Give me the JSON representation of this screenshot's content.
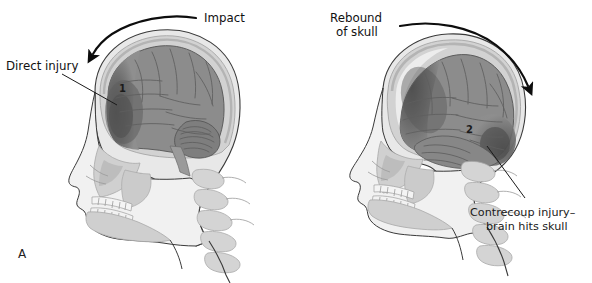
{
  "figure": {
    "panel_letter": "A",
    "background_color": "#ffffff",
    "caption_subject": "coup-contrecoup brain injury"
  },
  "labels": {
    "impact": "Impact",
    "direct_injury": "Direct injury",
    "rebound_of_skull_line1": "Rebound",
    "rebound_of_skull_line2": "of skull",
    "contrecoup_line1": "Contrecoup injury–",
    "contrecoup_line2": "brain hits skull"
  },
  "markers": {
    "coup_number": "1",
    "contrecoup_number": "2"
  },
  "panels": [
    {
      "id": "left-head",
      "name": "impact-phase-head",
      "description": "Sagittal view of head at moment of impact with direct injury at frontal lobe",
      "marker": "1"
    },
    {
      "id": "right-head",
      "name": "rebound-phase-head",
      "description": "Sagittal view of head during rebound with contrecoup injury at occipital region",
      "marker": "2"
    }
  ],
  "colors": {
    "brain_fill": "#8c8c8c",
    "brain_contusion": "#5a5a5a",
    "cerebellum": "#7e7e7e",
    "skull_bone": "#c9c9c9",
    "scalp": "#e3e3e3",
    "soft_tissue": "#d7d7d7",
    "outline": "#3a3a3a",
    "arrow": "#0d0d0d",
    "text": "#1a1a1a",
    "teeth": "#f2f2f2"
  }
}
